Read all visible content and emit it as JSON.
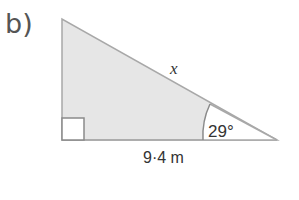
{
  "question": {
    "part_label": "b)"
  },
  "triangle": {
    "type": "right-angled triangle",
    "fill_color": "#e6e6e6",
    "stroke_color": "#a8a8a8",
    "hypotenuse_label": "x",
    "adjacent_side_label": "9·4 m",
    "angle_label": "29°",
    "right_angle_marker": "bottom-left"
  }
}
